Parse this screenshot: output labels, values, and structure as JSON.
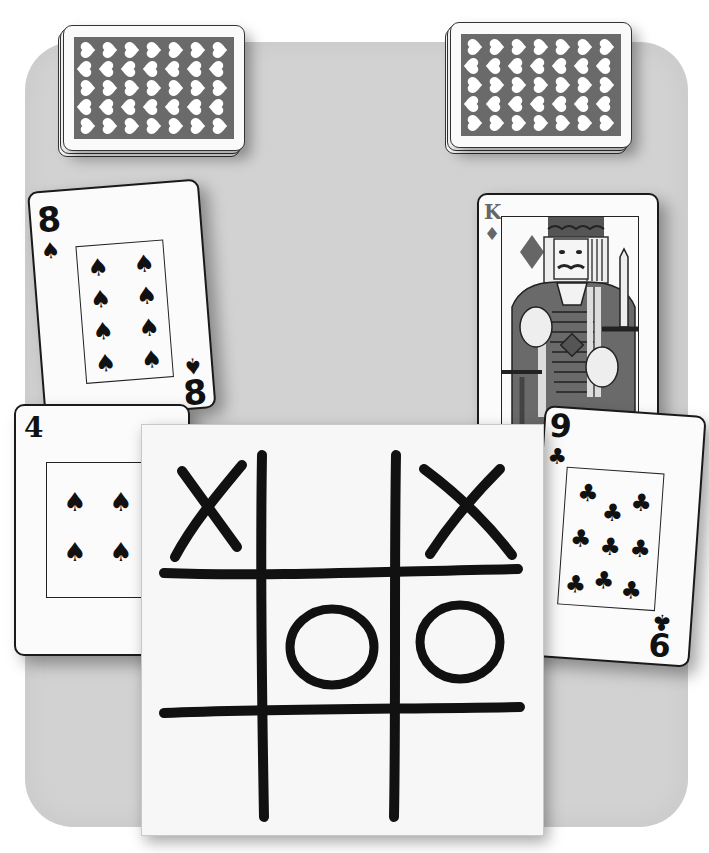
{
  "scene": {
    "description": "Playing cards and tic-tac-toe board on a rounded gray table",
    "colors": {
      "table": "#d2d2d2",
      "card": "#fbfbfb",
      "card_back": "#6a6a6a",
      "ink": "#111111",
      "king_ink": "#555555"
    }
  },
  "decks": [
    {
      "id": "left-deck",
      "back_icon": "heart-icon"
    },
    {
      "id": "right-deck",
      "back_icon": "heart-icon"
    }
  ],
  "cards": {
    "eight_spades": {
      "rank": "8",
      "suit": "♠",
      "suit_name": "spades",
      "pip_count": 8
    },
    "king_diamonds": {
      "rank": "K",
      "suit": "♦",
      "suit_name": "diamonds"
    },
    "four_spades": {
      "rank": "4",
      "suit": "♠",
      "suit_name": "spades",
      "pip_count": 4
    },
    "nine_clubs": {
      "rank": "9",
      "rank_bottom": "6",
      "suit": "♣",
      "suit_name": "clubs",
      "pip_count": 9
    }
  },
  "tictactoe": {
    "cells": [
      "X",
      "",
      "X",
      "",
      "O",
      "O",
      "",
      "",
      ""
    ]
  }
}
